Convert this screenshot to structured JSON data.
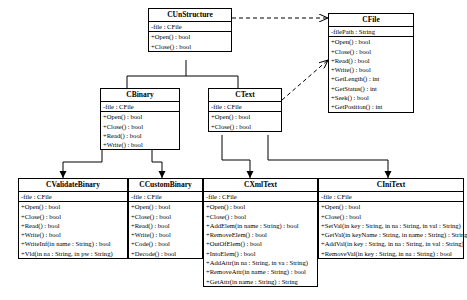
{
  "diagram": {
    "type": "uml-class-diagram",
    "classes": [
      {
        "id": "cunstructure",
        "name": "CUnStructure",
        "attributes": [
          "-file : CFile"
        ],
        "operations": [
          "+Open() : bool",
          "+Close() : bool"
        ]
      },
      {
        "id": "cfile",
        "name": "CFile",
        "attributes": [
          "-filePath : String"
        ],
        "operations": [
          "+Open() : bool",
          "+Close() : bool",
          "+Read() : bool",
          "+Write() : bool",
          "+GetLength() : int",
          "+GetStatus() : int",
          "+Seek() : bool",
          "+GetPosition() : int"
        ]
      },
      {
        "id": "cbinary",
        "name": "CBinary",
        "attributes": [
          "-file : CFile"
        ],
        "operations": [
          "+Open() : bool",
          "+Close() : bool",
          "+Read() : bool",
          "+Write() : bool"
        ]
      },
      {
        "id": "ctext",
        "name": "CText",
        "attributes": [
          "-file : CFile"
        ],
        "operations": [
          "+Open() : bool",
          "+Close() : bool"
        ]
      },
      {
        "id": "cvalidatebinary",
        "name": "CValidateBinary",
        "attributes": [
          "-file : CFile"
        ],
        "operations": [
          "+Open() : bool",
          "+Close() : bool",
          "+Read() : bool",
          "+Write() : bool",
          "+WriteInf(in name : String) : bool",
          "+Vld(in na : String, in pw : String)"
        ]
      },
      {
        "id": "ccustombinary",
        "name": "CCustomBinary",
        "attributes": [
          "-file : CFile"
        ],
        "operations": [
          "+Open() : bool",
          "+Close() : bool",
          "+Read() : bool",
          "+Write() : bool",
          "+Code() : bool",
          "+Decode() : bool"
        ]
      },
      {
        "id": "cxmltext",
        "name": "CXmlText",
        "attributes": [
          "-file : CFile"
        ],
        "operations": [
          "+Open() : bool",
          "+Close() : bool",
          "+AddElem(in name : String) : bool",
          "+RemoveElem() : bool",
          "+OutOfElem() : bool",
          "+IntoElem() : bool",
          "+AddAttr(in na : String, in va : String)",
          "+RemoveAttr(in name : String) : bool",
          "+GetAttr(in name : String) : String"
        ]
      },
      {
        "id": "cinitext",
        "name": "CIniText",
        "attributes": [
          "-file : CFile"
        ],
        "operations": [
          "+Open() : bool",
          "+Close() : bool",
          "+SetVal(in key : String, in na : String, in val : String)",
          "+GetVal(in keyName : String, in name : String) : String",
          "+AddVal(in key : String, in na : String, in val : String)",
          "+RemoveVal(in key : String, in na : String) : bool"
        ]
      }
    ],
    "relations": [
      {
        "from": "cunstructure",
        "to": "cfile",
        "type": "dependency-dashed-arrow"
      },
      {
        "from": "cbinary",
        "to": "cunstructure",
        "type": "generalization"
      },
      {
        "from": "ctext",
        "to": "cunstructure",
        "type": "generalization"
      },
      {
        "from": "ctext",
        "to": "cfile",
        "type": "dependency-dashed-arrow"
      },
      {
        "from": "cvalidatebinary",
        "to": "cbinary",
        "type": "generalization"
      },
      {
        "from": "ccustombinary",
        "to": "cbinary",
        "type": "generalization"
      },
      {
        "from": "cxmltext",
        "to": "ctext",
        "type": "generalization"
      },
      {
        "from": "cinitext",
        "to": "ctext",
        "type": "generalization"
      }
    ]
  }
}
